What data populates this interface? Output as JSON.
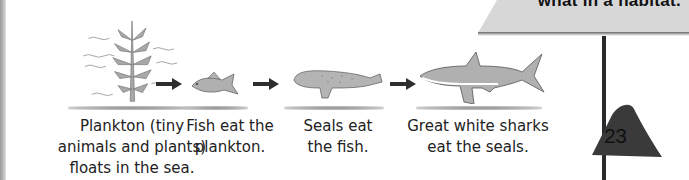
{
  "page": {
    "header_sign_text": "what in a habitat.",
    "page_number": "23"
  },
  "food_chain": {
    "stages": [
      {
        "organism": "plankton",
        "icon": "seaweed-plankton-icon",
        "caption": "Plankton (tiny\nanimals and plants)\nfloats in the sea."
      },
      {
        "organism": "fish",
        "icon": "fish-icon",
        "caption": "Fish eat the\nplankton."
      },
      {
        "organism": "seal",
        "icon": "seal-icon",
        "caption": "Seals eat\nthe fish."
      },
      {
        "organism": "great-white-shark",
        "icon": "shark-icon",
        "caption": "Great white sharks\neat the seals."
      }
    ],
    "arrows": [
      "arrow-right-icon",
      "arrow-right-icon",
      "arrow-right-icon"
    ]
  },
  "colors": {
    "sign": "#d7d7d7",
    "page_tab": "#3a3a3a",
    "illustration_gray": "#a8a8a8",
    "text": "#222222"
  }
}
